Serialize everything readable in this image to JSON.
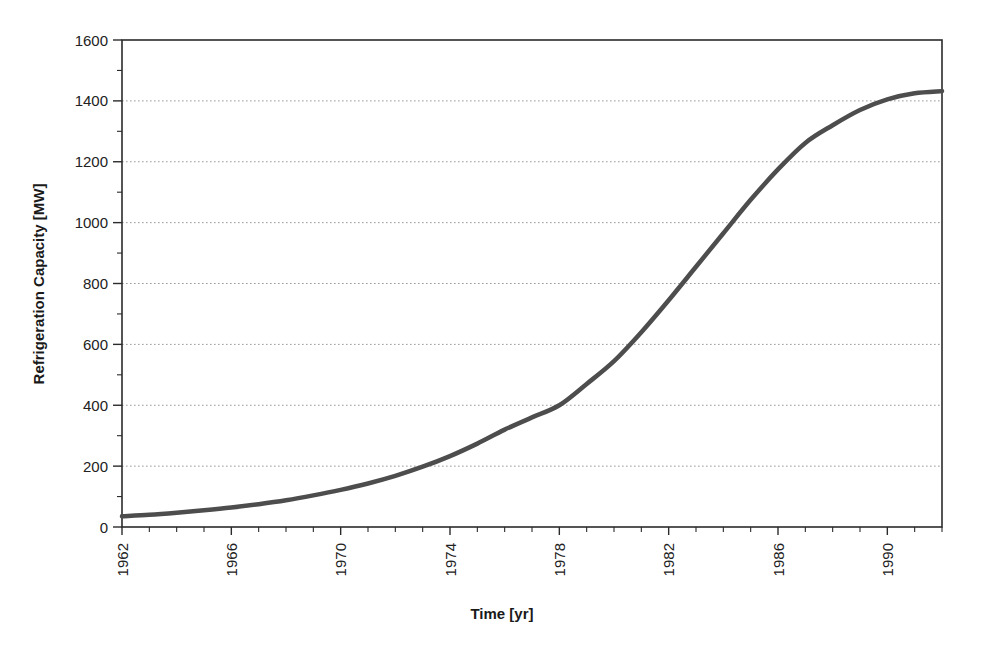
{
  "chart_data": {
    "type": "line",
    "title": "",
    "xlabel": "Time [yr]",
    "ylabel": "Refrigeration Capacity [MW]",
    "xlim": [
      1962,
      1992
    ],
    "ylim": [
      0,
      1600
    ],
    "grid": "horizontal-dotted",
    "legend": "none",
    "x_major_tick_step": 4,
    "x_minor_tick_step": 1,
    "y_major_tick_step": 200,
    "y_minor_tick_step": 100,
    "x_tick_labels": [
      "1962",
      "1966",
      "1970",
      "1974",
      "1978",
      "1982",
      "1986",
      "1990"
    ],
    "x_tick_label_values": [
      1962,
      1966,
      1970,
      1974,
      1978,
      1982,
      1986,
      1990
    ],
    "x_tick_label_rotation": -90,
    "y_tick_labels": [
      "0",
      "200",
      "400",
      "600",
      "800",
      "1000",
      "1200",
      "1400",
      "1600"
    ],
    "y_tick_label_values": [
      0,
      200,
      400,
      600,
      800,
      1000,
      1200,
      1400,
      1600
    ],
    "series": [
      {
        "name": "Refrigeration Capacity",
        "color": "#4d4d4d",
        "line_width": 4.5,
        "x": [
          1962,
          1963,
          1964,
          1965,
          1966,
          1967,
          1968,
          1969,
          1970,
          1971,
          1972,
          1973,
          1974,
          1975,
          1976,
          1977,
          1978,
          1979,
          1980,
          1981,
          1982,
          1983,
          1984,
          1985,
          1986,
          1987,
          1988,
          1989,
          1990,
          1991,
          1992
        ],
        "values": [
          35,
          40,
          47,
          55,
          64,
          75,
          88,
          104,
          122,
          143,
          168,
          198,
          233,
          274,
          320,
          360,
          400,
          470,
          545,
          640,
          745,
          855,
          965,
          1075,
          1175,
          1262,
          1320,
          1370,
          1405,
          1425,
          1432
        ]
      }
    ]
  },
  "plot_geometry": {
    "left": 122,
    "right": 942,
    "top": 40,
    "bottom": 527
  }
}
